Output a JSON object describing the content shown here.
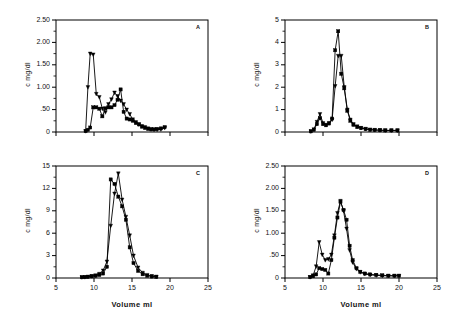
{
  "figure": {
    "shared_xlabel": "Volume  ml",
    "shared_ylabel": "c   mg/dl",
    "panels": [
      "A",
      "B",
      "C",
      "D"
    ]
  },
  "chart_data": [
    {
      "type": "line",
      "panel_label": "A",
      "title": "",
      "xlabel": "Volume  ml",
      "ylabel": "c   mg/dl",
      "xlim": [
        5,
        25
      ],
      "ylim": [
        0,
        2.5
      ],
      "xticks": [
        5,
        10,
        15,
        20,
        25
      ],
      "xticklabels": [
        "",
        "",
        "",
        "",
        ""
      ],
      "yticks": [
        0,
        0.5,
        1.0,
        1.5,
        2.0,
        2.5
      ],
      "yticklabels": [
        "0",
        ".50",
        "1.00",
        "1.50",
        "2.00",
        "2.50"
      ],
      "grid": false,
      "legend": "none",
      "series": [
        {
          "name": "series-triangle",
          "marker": "triangle",
          "x": [
            8.9,
            9.2,
            9.5,
            9.9,
            10.3,
            10.7,
            11.1,
            11.5,
            11.9,
            12.3,
            12.7,
            13.1,
            13.5,
            13.9,
            14.3,
            14.7,
            15.1,
            15.5,
            15.9,
            16.3,
            16.7,
            17.1,
            17.5,
            17.9,
            18.3,
            18.8,
            19.3
          ],
          "y": [
            0.02,
            1.0,
            1.75,
            1.73,
            0.85,
            0.78,
            0.52,
            0.44,
            0.62,
            0.73,
            0.88,
            0.8,
            0.7,
            0.62,
            0.5,
            0.4,
            0.28,
            0.22,
            0.17,
            0.13,
            0.11,
            0.08,
            0.06,
            0.05,
            0.05,
            0.06,
            0.09
          ]
        },
        {
          "name": "series-square",
          "marker": "square",
          "x": [
            8.9,
            9.2,
            9.5,
            9.9,
            10.3,
            10.7,
            11.1,
            11.5,
            11.9,
            12.3,
            12.7,
            13.1,
            13.5,
            13.9,
            14.3,
            14.7,
            15.1,
            15.5,
            15.9,
            16.3,
            16.7,
            17.1,
            17.5,
            17.9,
            18.3,
            18.8,
            19.3
          ],
          "y": [
            0.02,
            0.05,
            0.1,
            0.55,
            0.55,
            0.52,
            0.35,
            0.53,
            0.55,
            0.55,
            0.6,
            0.72,
            0.95,
            0.45,
            0.3,
            0.28,
            0.25,
            0.2,
            0.17,
            0.12,
            0.09,
            0.07,
            0.06,
            0.06,
            0.07,
            0.08,
            0.11
          ]
        }
      ]
    },
    {
      "type": "line",
      "panel_label": "B",
      "title": "",
      "xlabel": "Volume  ml",
      "ylabel": "c   mg/dl",
      "xlim": [
        5,
        25
      ],
      "ylim": [
        0,
        5
      ],
      "xticks": [
        5,
        10,
        15,
        20,
        25
      ],
      "xticklabels": [
        "",
        "",
        "",
        "",
        ""
      ],
      "yticks": [
        0,
        1,
        2,
        3,
        4,
        5
      ],
      "yticklabels": [
        "0",
        "1",
        "2",
        "3",
        "4",
        "5"
      ],
      "grid": false,
      "legend": "none",
      "series": [
        {
          "name": "series-triangle",
          "marker": "triangle",
          "x": [
            8.4,
            8.8,
            9.2,
            9.6,
            10.0,
            10.4,
            10.8,
            11.2,
            11.6,
            12.0,
            12.4,
            12.8,
            13.2,
            13.6,
            14.0,
            14.5,
            15.0,
            15.6,
            16.2,
            16.8,
            17.5,
            18.2,
            19.0,
            19.8
          ],
          "y": [
            0.03,
            0.12,
            0.45,
            0.8,
            0.4,
            0.32,
            0.4,
            0.55,
            2.05,
            3.4,
            3.4,
            2.0,
            1.0,
            0.55,
            0.35,
            0.25,
            0.18,
            0.14,
            0.11,
            0.09,
            0.08,
            0.07,
            0.07,
            0.07
          ]
        },
        {
          "name": "series-square",
          "marker": "square",
          "x": [
            8.4,
            8.8,
            9.2,
            9.6,
            10.0,
            10.4,
            10.8,
            11.2,
            11.6,
            12.0,
            12.4,
            12.8,
            13.2,
            13.6,
            14.0,
            14.5,
            15.0,
            15.6,
            16.2,
            16.8,
            17.5,
            18.2,
            19.0,
            19.8
          ],
          "y": [
            0.03,
            0.1,
            0.35,
            0.62,
            0.35,
            0.3,
            0.38,
            0.6,
            3.65,
            4.5,
            2.6,
            1.95,
            0.95,
            0.5,
            0.32,
            0.22,
            0.17,
            0.13,
            0.1,
            0.09,
            0.08,
            0.07,
            0.07,
            0.07
          ]
        }
      ]
    },
    {
      "type": "line",
      "panel_label": "C",
      "title": "",
      "xlabel": "Volume  ml",
      "ylabel": "c   mg/dl",
      "xlim": [
        5,
        25
      ],
      "ylim": [
        0,
        15
      ],
      "xticks": [
        5,
        10,
        15,
        20,
        25
      ],
      "xticklabels": [
        "5",
        "10",
        "15",
        "20",
        "25"
      ],
      "yticks": [
        0,
        3,
        6,
        9,
        12,
        15
      ],
      "yticklabels": [
        "0",
        "3",
        "6",
        "9",
        "12",
        "15"
      ],
      "grid": false,
      "legend": "none",
      "series": [
        {
          "name": "series-triangle",
          "marker": "triangle",
          "x": [
            8.4,
            8.8,
            9.2,
            9.7,
            10.2,
            10.7,
            11.2,
            11.7,
            12.2,
            12.7,
            13.2,
            13.7,
            14.2,
            14.7,
            15.2,
            15.8,
            16.4,
            17.0,
            17.6,
            18.2
          ],
          "y": [
            0.1,
            0.12,
            0.18,
            0.25,
            0.35,
            0.55,
            1.0,
            2.2,
            7.0,
            11.3,
            14.0,
            10.5,
            8.2,
            5.7,
            3.0,
            1.4,
            0.7,
            0.4,
            0.25,
            0.18
          ]
        },
        {
          "name": "series-square",
          "marker": "square",
          "x": [
            8.4,
            8.8,
            9.2,
            9.7,
            10.2,
            10.7,
            11.2,
            11.7,
            12.2,
            12.7,
            13.2,
            13.7,
            14.2,
            14.7,
            15.2,
            15.8,
            16.4,
            17.0,
            17.6,
            18.2
          ],
          "y": [
            0.1,
            0.12,
            0.16,
            0.22,
            0.3,
            0.4,
            0.6,
            1.5,
            13.2,
            12.6,
            10.9,
            9.6,
            7.8,
            4.1,
            2.0,
            0.95,
            0.5,
            0.3,
            0.2,
            0.15
          ]
        }
      ]
    },
    {
      "type": "line",
      "panel_label": "D",
      "title": "",
      "xlabel": "Volume  ml",
      "ylabel": "c   mg/dl",
      "xlim": [
        5,
        25
      ],
      "ylim": [
        0,
        2.5
      ],
      "xticks": [
        5,
        10,
        15,
        20,
        25
      ],
      "xticklabels": [
        "5",
        "10",
        "15",
        "20",
        "25"
      ],
      "yticks": [
        0,
        0.5,
        1.0,
        1.5,
        2.0,
        2.5
      ],
      "yticklabels": [
        "0",
        ".50",
        "1.00",
        "1.50",
        "2.00",
        "2.50"
      ],
      "grid": false,
      "legend": "none",
      "series": [
        {
          "name": "series-triangle",
          "marker": "triangle",
          "x": [
            8.3,
            8.7,
            9.1,
            9.5,
            9.9,
            10.3,
            10.7,
            11.1,
            11.5,
            11.9,
            12.3,
            12.7,
            13.1,
            13.5,
            13.9,
            14.4,
            14.9,
            15.5,
            16.2,
            17.0,
            17.8,
            18.6,
            19.4,
            20.0
          ],
          "y": [
            0.02,
            0.06,
            0.26,
            0.8,
            0.52,
            0.4,
            0.42,
            0.52,
            0.95,
            1.45,
            1.72,
            1.5,
            1.1,
            0.62,
            0.35,
            0.2,
            0.13,
            0.09,
            0.07,
            0.06,
            0.05,
            0.05,
            0.05,
            0.05
          ]
        },
        {
          "name": "series-square",
          "marker": "square",
          "x": [
            8.3,
            8.7,
            9.1,
            9.5,
            9.9,
            10.3,
            10.7,
            11.1,
            11.5,
            11.9,
            12.3,
            12.7,
            13.1,
            13.5,
            13.9,
            14.4,
            14.9,
            15.5,
            16.2,
            17.0,
            17.8,
            18.6,
            19.4,
            20.0
          ],
          "y": [
            0.02,
            0.04,
            0.08,
            0.22,
            0.2,
            0.18,
            0.1,
            0.4,
            0.9,
            1.35,
            1.7,
            1.52,
            1.3,
            0.72,
            0.4,
            0.22,
            0.14,
            0.1,
            0.08,
            0.07,
            0.06,
            0.05,
            0.05,
            0.05
          ]
        }
      ]
    }
  ]
}
